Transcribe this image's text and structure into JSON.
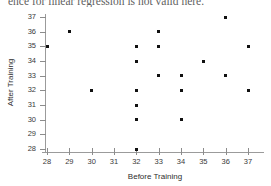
{
  "caption": "ence for linear regression is not valid here.",
  "chart_data": {
    "type": "scatter",
    "title": "",
    "xlabel": "Before Training",
    "ylabel": "After Training",
    "xlim": [
      27.4,
      37.6
    ],
    "ylim": [
      27.4,
      37.4
    ],
    "grid": false,
    "legend": "none",
    "marker_color": "#111111",
    "axis_color": "#9b9b9b",
    "xticks": [
      28,
      29,
      30,
      31,
      32,
      33,
      34,
      35,
      36,
      37
    ],
    "yticks": [
      28,
      29,
      30,
      31,
      32,
      33,
      34,
      35,
      36,
      37
    ],
    "points": [
      {
        "x": 28,
        "y": 35
      },
      {
        "x": 29,
        "y": 36
      },
      {
        "x": 30,
        "y": 32
      },
      {
        "x": 32,
        "y": 35
      },
      {
        "x": 32,
        "y": 34
      },
      {
        "x": 32,
        "y": 32
      },
      {
        "x": 32,
        "y": 31
      },
      {
        "x": 32,
        "y": 30
      },
      {
        "x": 32,
        "y": 28
      },
      {
        "x": 33,
        "y": 36
      },
      {
        "x": 33,
        "y": 35
      },
      {
        "x": 33,
        "y": 33
      },
      {
        "x": 34,
        "y": 33
      },
      {
        "x": 34,
        "y": 32
      },
      {
        "x": 34,
        "y": 30
      },
      {
        "x": 35,
        "y": 34
      },
      {
        "x": 36,
        "y": 37
      },
      {
        "x": 36,
        "y": 33
      },
      {
        "x": 37,
        "y": 35
      },
      {
        "x": 37,
        "y": 32
      }
    ]
  }
}
